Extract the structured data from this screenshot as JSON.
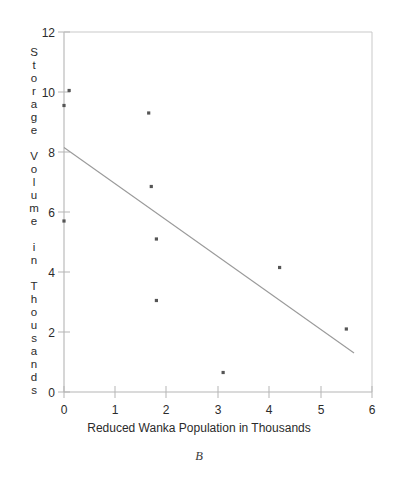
{
  "chart_data": {
    "type": "scatter",
    "title": "",
    "xlabel": "Reduced Wanka Population in Thousands",
    "ylabel": "Storage Volume in Thousands",
    "ylabel_stacked": "S\nt\no\nr\na\ng\ne\n\nV\no\nl\nu\nm\ne\n\ni\nn\n\nT\nh\no\nu\ns\na\nn\nd\ns",
    "caption": "B",
    "xlim": [
      0,
      6
    ],
    "ylim": [
      0,
      12
    ],
    "xticks": [
      "0",
      "1",
      "2",
      "3",
      "4",
      "5",
      "6"
    ],
    "yticks": [
      "0",
      "2",
      "4",
      "6",
      "8",
      "10",
      "12"
    ],
    "xtick_values": [
      0,
      1,
      2,
      3,
      4,
      5,
      6
    ],
    "ytick_values": [
      0,
      2,
      4,
      6,
      8,
      10,
      12
    ],
    "grid": false,
    "legend": "none",
    "marker": "small-square",
    "marker_color": "#555555",
    "line_color": "#9a9a9a",
    "axis_color": "#b0b0b0",
    "points": [
      {
        "x": 0.1,
        "y": 10.05
      },
      {
        "x": 0.0,
        "y": 9.55
      },
      {
        "x": 1.65,
        "y": 9.3
      },
      {
        "x": 1.7,
        "y": 6.85
      },
      {
        "x": 0.0,
        "y": 5.7
      },
      {
        "x": 1.8,
        "y": 5.1
      },
      {
        "x": 4.2,
        "y": 4.15
      },
      {
        "x": 1.8,
        "y": 3.05
      },
      {
        "x": 5.5,
        "y": 2.1
      },
      {
        "x": 3.1,
        "y": 0.65
      }
    ],
    "trend_line": {
      "label": "regression line",
      "x_start": 0.0,
      "y_start": 8.15,
      "x_end": 5.65,
      "y_end": 1.3
    }
  }
}
